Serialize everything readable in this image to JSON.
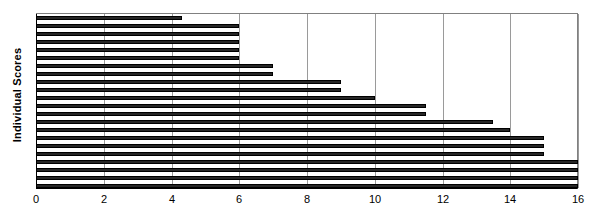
{
  "chart_data": {
    "type": "bar",
    "orientation": "horizontal",
    "title": "",
    "subtitle": "",
    "xlabel": "",
    "ylabel": "Individual Scores",
    "xlim": [
      0,
      16
    ],
    "ylim": null,
    "xticks": [
      0,
      2,
      4,
      6,
      8,
      10,
      12,
      14,
      16
    ],
    "xtick_labels": [
      "0",
      "2",
      "4",
      "6",
      "8",
      "10",
      "12",
      "14",
      "16"
    ],
    "grid": true,
    "grid_axis": "x",
    "legend": false,
    "legend_position": "none",
    "bar_color": "#262626",
    "bar_edge_color": "#000000",
    "grid_color": "#9a9a9a",
    "axis_color": "#000000",
    "background_color": "#ffffff",
    "categories": [
      "1",
      "2",
      "3",
      "4",
      "5",
      "6",
      "7",
      "8",
      "9",
      "10",
      "11",
      "12",
      "13",
      "14",
      "15",
      "16",
      "17",
      "18",
      "19",
      "20",
      "21",
      "22"
    ],
    "values": [
      4.3,
      6,
      6,
      6,
      6,
      6,
      7,
      7,
      9,
      9,
      10,
      11.5,
      11.5,
      13.5,
      14,
      15,
      15,
      15,
      16,
      16,
      16,
      16
    ],
    "n_bars": 22
  },
  "axis": {
    "y_title": "Individual Scores"
  }
}
